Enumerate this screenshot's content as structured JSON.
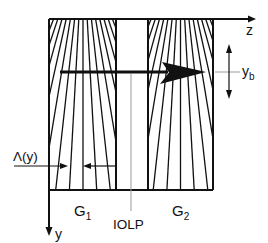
{
  "axes": {
    "horizontal_label": "z",
    "vertical_label": "y"
  },
  "beam": {
    "position_label_main": "y",
    "position_label_sub": "b"
  },
  "period": {
    "label": "Λ(y)"
  },
  "gratings": [
    {
      "label_main": "G",
      "label_sub": "1"
    },
    {
      "label_main": "G",
      "label_sub": "2"
    }
  ],
  "iolp": {
    "label": "IOLP"
  }
}
